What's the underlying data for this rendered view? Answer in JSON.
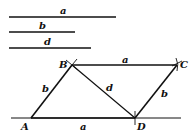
{
  "segments": [
    {
      "label": "a",
      "x1": 9,
      "x2": 116,
      "y": 17
    },
    {
      "label": "b",
      "x1": 9,
      "x2": 75,
      "y": 32
    },
    {
      "label": "d",
      "x1": 9,
      "x2": 91,
      "y": 48
    }
  ],
  "points": {
    "A": {
      "label": "A",
      "x": 31,
      "y": 118
    },
    "B": {
      "label": "B",
      "x": 72,
      "y": 65
    },
    "C": {
      "label": "C",
      "x": 177,
      "y": 65
    },
    "D": {
      "label": "D",
      "x": 135,
      "y": 118
    }
  },
  "edge_labels": {
    "AD": "a",
    "BC": "a",
    "AB": "b",
    "DC": "b",
    "BD": "d"
  },
  "colors": {
    "stroke": "#111111",
    "background": "#ffffff"
  }
}
